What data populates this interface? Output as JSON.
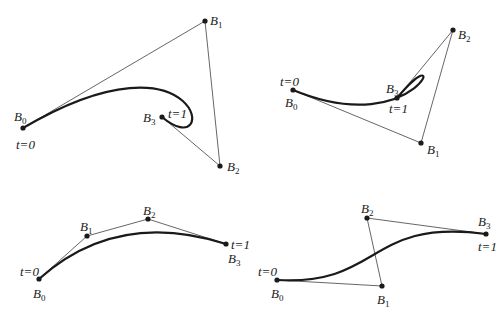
{
  "colors": {
    "curve": "#1a1a1a",
    "polygon": "#555555",
    "background": "#ffffff"
  },
  "panels": [
    {
      "id": "top-left",
      "points": {
        "B0": [
          23,
          128
        ],
        "B1": [
          205,
          21
        ],
        "B2": [
          220,
          166
        ],
        "B3": [
          162,
          117
        ]
      },
      "labels": [
        {
          "text": "B",
          "sub": "0",
          "x": 14,
          "y": 110
        },
        {
          "text": "t=0",
          "sub": "",
          "x": 16,
          "y": 138
        },
        {
          "text": "B",
          "sub": "1",
          "x": 210,
          "y": 14
        },
        {
          "text": "B",
          "sub": "2",
          "x": 227,
          "y": 160
        },
        {
          "text": "B",
          "sub": "3",
          "x": 143,
          "y": 111
        },
        {
          "text": "t=1",
          "sub": "",
          "x": 168,
          "y": 107
        }
      ]
    },
    {
      "id": "top-right",
      "points": {
        "B0": [
          293,
          90
        ],
        "B1": [
          421,
          143
        ],
        "B2": [
          453,
          30
        ],
        "B3": [
          397,
          98
        ]
      },
      "labels": [
        {
          "text": "t=0",
          "sub": "",
          "x": 280,
          "y": 75
        },
        {
          "text": "B",
          "sub": "0",
          "x": 285,
          "y": 96
        },
        {
          "text": "B",
          "sub": "1",
          "x": 427,
          "y": 143
        },
        {
          "text": "B",
          "sub": "2",
          "x": 458,
          "y": 28
        },
        {
          "text": "B",
          "sub": "3",
          "x": 386,
          "y": 82
        },
        {
          "text": "t=1",
          "sub": "",
          "x": 389,
          "y": 102
        }
      ]
    },
    {
      "id": "bottom-left",
      "points": {
        "B0": [
          39,
          279
        ],
        "B1": [
          87,
          236
        ],
        "B2": [
          148,
          219
        ],
        "B3": [
          226,
          244
        ]
      },
      "labels": [
        {
          "text": "t=0",
          "sub": "",
          "x": 20,
          "y": 265
        },
        {
          "text": "B",
          "sub": "0",
          "x": 33,
          "y": 287
        },
        {
          "text": "B",
          "sub": "1",
          "x": 80,
          "y": 220
        },
        {
          "text": "B",
          "sub": "2",
          "x": 143,
          "y": 204
        },
        {
          "text": "t=1",
          "sub": "",
          "x": 231,
          "y": 238
        },
        {
          "text": "B",
          "sub": "3",
          "x": 228,
          "y": 252
        }
      ]
    },
    {
      "id": "bottom-right",
      "points": {
        "B0": [
          277,
          280
        ],
        "B1": [
          382,
          286
        ],
        "B2": [
          367,
          218
        ],
        "B3": [
          486,
          234
        ]
      },
      "labels": [
        {
          "text": "t=0",
          "sub": "",
          "x": 258,
          "y": 265
        },
        {
          "text": "B",
          "sub": "0",
          "x": 271,
          "y": 287
        },
        {
          "text": "B",
          "sub": "1",
          "x": 377,
          "y": 293
        },
        {
          "text": "B",
          "sub": "2",
          "x": 361,
          "y": 202
        },
        {
          "text": "B",
          "sub": "3",
          "x": 478,
          "y": 215
        },
        {
          "text": "t=1",
          "sub": "",
          "x": 478,
          "y": 240
        }
      ]
    }
  ]
}
